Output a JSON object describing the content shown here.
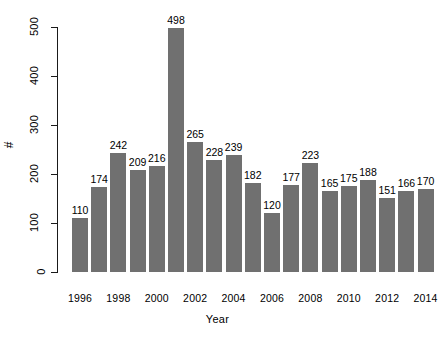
{
  "chart_data": {
    "type": "bar",
    "title": "",
    "xlabel": "Year",
    "ylabel": "#",
    "categories": [
      "1996",
      "1997",
      "1998",
      "1999",
      "2000",
      "2001",
      "2002",
      "2003",
      "2004",
      "2005",
      "2006",
      "2007",
      "2008",
      "2009",
      "2010",
      "2011",
      "2012",
      "2013",
      "2014"
    ],
    "values": [
      110,
      174,
      242,
      209,
      216,
      498,
      265,
      228,
      239,
      182,
      120,
      177,
      223,
      165,
      175,
      188,
      151,
      166,
      170
    ],
    "bar_labels": [
      "110",
      "174",
      "242",
      "209",
      "216",
      "498",
      "265",
      "228",
      "239",
      "182",
      "120",
      "177",
      "223",
      "165",
      "175",
      "188",
      "151",
      "166",
      "170"
    ],
    "ylim": [
      0,
      500
    ],
    "y_ticks": [
      0,
      100,
      200,
      300,
      400,
      500
    ],
    "y_tick_labels": [
      "0",
      "100",
      "200",
      "300",
      "400",
      "500"
    ],
    "x_tick_labels": [
      "1996",
      "1998",
      "2000",
      "2002",
      "2004",
      "2006",
      "2008",
      "2010",
      "2012",
      "2014"
    ],
    "x_tick_categories": [
      "1996",
      "1998",
      "2000",
      "2002",
      "2004",
      "2006",
      "2008",
      "2010",
      "2012",
      "2014"
    ],
    "grid": false,
    "legend": null,
    "bar_color": "#707070",
    "axis_color": "#1a1a1a",
    "background": "#ffffff"
  }
}
